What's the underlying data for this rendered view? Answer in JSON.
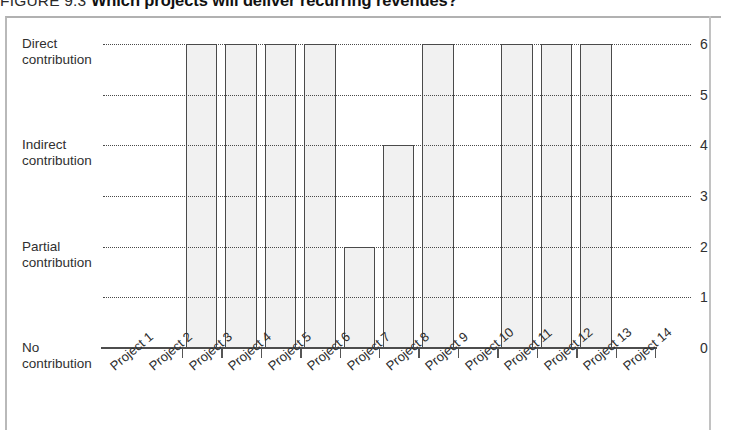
{
  "figure": {
    "figure_number": "FIGURE 9.3",
    "title": "Which projects will deliver recurring revenues?"
  },
  "chart_data": {
    "type": "bar",
    "title": "Which projects will deliver recurring revenues?",
    "xlabel": "",
    "ylabel": "",
    "ylim": [
      0,
      6
    ],
    "grid": true,
    "legend": "none",
    "categories": [
      "Project 1",
      "Project 2",
      "Project 3",
      "Project 4",
      "Project 5",
      "Project 6",
      "Project 7",
      "Project 8",
      "Project 9",
      "Project 10",
      "Project 11",
      "Project 12",
      "Project 13",
      "Project 14"
    ],
    "values": [
      0,
      0,
      6,
      6,
      6,
      6,
      2,
      4,
      6,
      0,
      6,
      6,
      6,
      0
    ],
    "y_tick_values": [
      6,
      5,
      4,
      3,
      2,
      1,
      0
    ],
    "y_tick_labels_right": [
      "6",
      "5",
      "4",
      "3",
      "2",
      "1",
      "0"
    ],
    "y_category_scale": [
      {
        "value": 6,
        "label_line1": "Direct",
        "label_line2": "contribution"
      },
      {
        "value": 4,
        "label_line1": "Indirect",
        "label_line2": "contribution"
      },
      {
        "value": 2,
        "label_line1": "Partial",
        "label_line2": "contribution"
      },
      {
        "value": 0,
        "label_line1": "No",
        "label_line2": "contribution"
      }
    ],
    "bar_fill_color": "#f1f1f1",
    "bar_border_color": "#4a4a4a",
    "gridline_color": "#4a4a4a",
    "axis_color": "#4d4d4d"
  }
}
